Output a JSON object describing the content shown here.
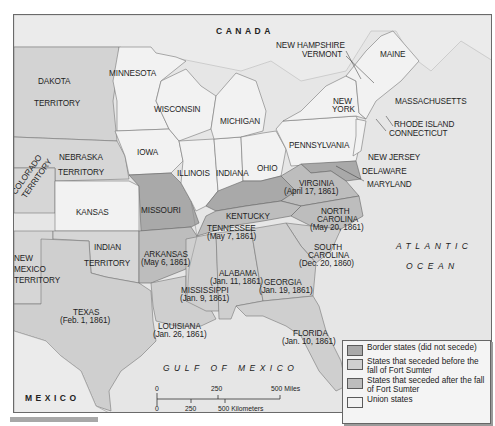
{
  "map": {
    "title": "",
    "countries": {
      "canada": "CANADA",
      "mexico": "MEXICO"
    },
    "water_bodies": {
      "atlantic_line1": "ATLANTIC",
      "atlantic_line2": "OCEAN",
      "gulf": "GULF OF MEXICO"
    },
    "states": {
      "dakota": [
        "DAKOTA",
        "TERRITORY"
      ],
      "minnesota": "MINNESOTA",
      "wisconsin": "WISCONSIN",
      "michigan": "MICHIGAN",
      "iowa": "IOWA",
      "nebraska": [
        "NEBRASKA",
        "TERRITORY"
      ],
      "colorado": [
        "COLORADO",
        "TERRITORY"
      ],
      "kansas": "KANSAS",
      "illinois": "ILLINOIS",
      "indiana": "INDIANA",
      "ohio": "OHIO",
      "pennsylvania": "PENNSYLVANIA",
      "new_york": [
        "NEW",
        "YORK"
      ],
      "new_hampshire": "NEW HAMPSHIRE",
      "vermont": "VERMONT",
      "maine": "MAINE",
      "massachusetts": "MASSACHUSETTS",
      "rhode_island": "RHODE ISLAND",
      "connecticut": "CONNECTICUT",
      "new_jersey": "NEW JERSEY",
      "delaware": "DELAWARE",
      "maryland": "MARYLAND",
      "missouri": "MISSOURI",
      "kentucky": "KENTUCKY",
      "virginia": [
        "VIRGINIA",
        "(April 17, 1861)"
      ],
      "north_carolina": [
        "NORTH",
        "CAROLINA",
        "(May 20, 1861)"
      ],
      "tennessee": [
        "TENNESSEE",
        "(May 7, 1861)"
      ],
      "south_carolina": [
        "SOUTH",
        "CAROLINA",
        "(Dec. 20, 1860)"
      ],
      "arkansas": [
        "ARKANSAS",
        "(May 6, 1861)"
      ],
      "indian_territory": [
        "INDIAN",
        "TERRITORY"
      ],
      "new_mexico": [
        "NEW",
        "MEXICO",
        "TERRITORY"
      ],
      "alabama": [
        "ALABAMA",
        "(Jan. 11, 1861)"
      ],
      "georgia": [
        "GEORGIA",
        "(Jan. 19, 1861)"
      ],
      "mississippi": [
        "MISSISSIPPI",
        "(Jan. 9, 1861)"
      ],
      "texas": [
        "TEXAS",
        "(Feb. 1, 1861)"
      ],
      "louisiana": [
        "LOUISIANA",
        "(Jan. 26, 1861)"
      ],
      "florida": [
        "FLORIDA",
        "(Jan. 10, 1861)"
      ]
    }
  },
  "legend": {
    "items": [
      {
        "label": "Border states (did not secede)",
        "color": "#a9a9a9"
      },
      {
        "label": "States that seceded before the fall of Fort Sumter",
        "color": "#cfcfcf"
      },
      {
        "label": "States that seceded after the fall of Fort Sumter",
        "color": "#bdbdbd"
      },
      {
        "label": "Union states",
        "color": "#f2f2f2"
      }
    ]
  },
  "scale": {
    "miles": {
      "zero": "0",
      "mid": "250",
      "end": "500 Miles"
    },
    "km": {
      "zero": "0",
      "mid": "250",
      "end": "500 Kilometers"
    }
  },
  "colors": {
    "border_states": "#a9a9a9",
    "seceded_before": "#cfcfcf",
    "seceded_after": "#bdbdbd",
    "union": "#f2f2f2",
    "territory": "#d8d8d8",
    "water": "#e6e6e6"
  }
}
